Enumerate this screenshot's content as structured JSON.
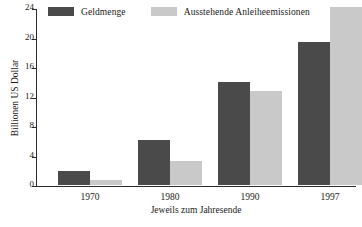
{
  "chart_data": {
    "type": "bar",
    "title": "",
    "categories": [
      "1970",
      "1980",
      "1990",
      "1997"
    ],
    "series": [
      {
        "name": "Geldmenge",
        "values": [
          1.9,
          6.1,
          14.0,
          19.4
        ],
        "color": "#4a4a4a"
      },
      {
        "name": "Ausstehende Anleiheemissionen",
        "values": [
          0.7,
          3.2,
          12.7,
          24.1
        ],
        "color": "#c9c9c9"
      }
    ],
    "xlabel": "Jeweils zum Jahresende",
    "ylabel": "Billionen US Dollar",
    "ylim": [
      0,
      24
    ],
    "yticks": [
      0,
      4,
      8,
      12,
      16,
      20,
      24
    ],
    "ytick_labels": [
      "0",
      "4",
      "8",
      "12",
      "16",
      "20",
      "24"
    ],
    "grid": false,
    "legend_position": "top-left"
  },
  "legend": {
    "entries": [
      {
        "label": "Geldmenge"
      },
      {
        "label": "Ausstehende Anleiheemissionen"
      }
    ]
  },
  "axes": {
    "y_title": "Billionen US Dollar",
    "x_title": "Jeweils zum Jahresende"
  }
}
